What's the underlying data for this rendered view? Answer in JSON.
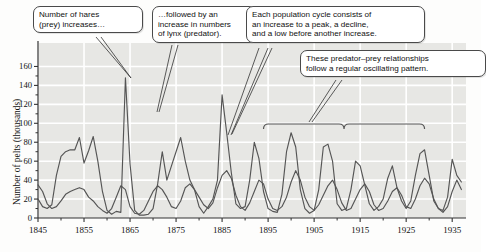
{
  "chart_data": {
    "type": "line",
    "title": "",
    "xlabel": "",
    "ylabel": "Number of pelts (thousands)",
    "xlim": [
      1845,
      1938
    ],
    "ylim": [
      0,
      170
    ],
    "ytick_step": 20,
    "yticks": [
      0,
      20,
      40,
      60,
      80,
      100,
      120,
      140,
      160
    ],
    "xticks": [
      1845,
      1855,
      1865,
      1875,
      1885,
      1895,
      1905,
      1915,
      1925,
      1935
    ],
    "xticks_minor": [
      1850,
      1860,
      1870,
      1880,
      1890,
      1900,
      1910,
      1920,
      1930
    ],
    "grid": true,
    "legend": "none",
    "plot_bg": "#e7e7e4",
    "gridline_color": "#ffffff",
    "line_color": "#555555",
    "series": [
      {
        "name": "Hare (prey)",
        "color": "#555555",
        "x": [
          1845,
          1846,
          1847,
          1848,
          1849,
          1850,
          1851,
          1852,
          1853,
          1854,
          1855,
          1856,
          1857,
          1858,
          1859,
          1860,
          1861,
          1862,
          1863,
          1864,
          1865,
          1866,
          1867,
          1868,
          1869,
          1870,
          1871,
          1872,
          1873,
          1874,
          1875,
          1876,
          1877,
          1878,
          1879,
          1880,
          1881,
          1882,
          1883,
          1884,
          1885,
          1886,
          1887,
          1888,
          1889,
          1890,
          1891,
          1892,
          1893,
          1894,
          1895,
          1896,
          1897,
          1898,
          1899,
          1900,
          1901,
          1902,
          1903,
          1904,
          1905,
          1906,
          1907,
          1908,
          1909,
          1910,
          1911,
          1912,
          1913,
          1914,
          1915,
          1916,
          1917,
          1918,
          1919,
          1920,
          1921,
          1922,
          1923,
          1924,
          1925,
          1926,
          1927,
          1928,
          1929,
          1930,
          1931,
          1932,
          1933,
          1934,
          1935,
          1936,
          1937
        ],
        "values": [
          20,
          12,
          10,
          14,
          45,
          65,
          70,
          72,
          72,
          85,
          58,
          71,
          86,
          60,
          28,
          8,
          4,
          7,
          6,
          148,
          57,
          8,
          3,
          3,
          4,
          10,
          36,
          70,
          40,
          55,
          70,
          85,
          60,
          40,
          30,
          12,
          5,
          12,
          20,
          40,
          130,
          90,
          48,
          15,
          10,
          12,
          40,
          80,
          63,
          28,
          10,
          7,
          6,
          25,
          70,
          90,
          75,
          30,
          10,
          5,
          8,
          30,
          75,
          78,
          60,
          15,
          8,
          10,
          30,
          60,
          55,
          35,
          15,
          8,
          12,
          20,
          42,
          55,
          32,
          18,
          10,
          18,
          45,
          68,
          72,
          45,
          18,
          10,
          8,
          22,
          62,
          45,
          38
        ]
      },
      {
        "name": "Lynx (predator)",
        "color": "#555555",
        "x": [
          1845,
          1846,
          1847,
          1848,
          1849,
          1850,
          1851,
          1852,
          1853,
          1854,
          1855,
          1856,
          1857,
          1858,
          1859,
          1860,
          1861,
          1862,
          1863,
          1864,
          1865,
          1866,
          1867,
          1868,
          1869,
          1870,
          1871,
          1872,
          1873,
          1874,
          1875,
          1876,
          1877,
          1878,
          1879,
          1880,
          1881,
          1882,
          1883,
          1884,
          1885,
          1886,
          1887,
          1888,
          1889,
          1890,
          1891,
          1892,
          1893,
          1894,
          1895,
          1896,
          1897,
          1898,
          1899,
          1900,
          1901,
          1902,
          1903,
          1904,
          1905,
          1906,
          1907,
          1908,
          1909,
          1910,
          1911,
          1912,
          1913,
          1914,
          1915,
          1916,
          1917,
          1918,
          1919,
          1920,
          1921,
          1922,
          1923,
          1924,
          1925,
          1926,
          1927,
          1928,
          1929,
          1930,
          1931,
          1932,
          1933,
          1934,
          1935,
          1936,
          1937
        ],
        "values": [
          35,
          28,
          15,
          10,
          12,
          18,
          25,
          28,
          30,
          32,
          30,
          22,
          18,
          12,
          8,
          5,
          10,
          22,
          34,
          30,
          12,
          5,
          4,
          8,
          18,
          28,
          34,
          30,
          22,
          12,
          10,
          18,
          32,
          36,
          30,
          22,
          14,
          10,
          16,
          32,
          45,
          50,
          42,
          24,
          12,
          8,
          16,
          28,
          40,
          36,
          20,
          10,
          8,
          12,
          22,
          38,
          50,
          40,
          22,
          12,
          8,
          14,
          24,
          34,
          40,
          30,
          16,
          8,
          10,
          20,
          30,
          36,
          28,
          14,
          8,
          10,
          18,
          28,
          32,
          24,
          12,
          10,
          20,
          34,
          42,
          36,
          20,
          10,
          6,
          12,
          28,
          40,
          30
        ]
      }
    ],
    "annotation_bracket": {
      "label": "oscillating-pattern-bracket",
      "x_start": 1894,
      "x_end": 1929
    }
  },
  "callouts": [
    {
      "name": "callout-hares-increase",
      "text": "Number of hares\n(prey) increases…"
    },
    {
      "name": "callout-lynx-increase",
      "text": "…followed by an\nincrease in numbers\nof lynx (predator)."
    },
    {
      "name": "callout-population-cycle",
      "text": "Each population cycle consists of\nan increase to a peak, a decline,\nand a low before another increase."
    },
    {
      "name": "callout-oscillating-pattern",
      "text": "These predator–prey relationships\nfollow a regular oscillating pattern."
    }
  ]
}
